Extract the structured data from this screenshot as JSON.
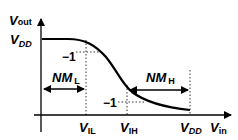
{
  "diagram": {
    "y_axis": {
      "label": "V",
      "label_sub": "out"
    },
    "x_axis": {
      "label": "V",
      "label_sub": "in"
    },
    "vdd_level_label": {
      "main": "V",
      "sub": "DD"
    },
    "slope_marks": [
      {
        "text": "−1",
        "at": "V_IL"
      },
      {
        "text": "−1",
        "at": "V_IH"
      }
    ],
    "noise_margins": [
      {
        "main": "NM",
        "sub": "L"
      },
      {
        "main": "NM",
        "sub": "H"
      }
    ],
    "x_ticks": [
      {
        "main": "V",
        "sub": "IL"
      },
      {
        "main": "V",
        "sub": "IH"
      },
      {
        "main": "V",
        "sub": "DD"
      }
    ],
    "colors": {
      "line": "#000000",
      "background": "#ffffff"
    }
  }
}
